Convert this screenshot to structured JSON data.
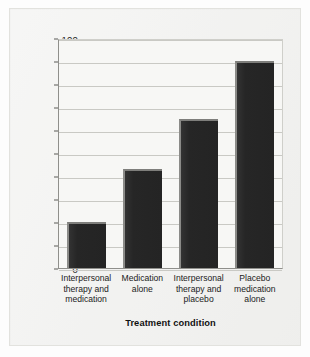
{
  "chart_data": {
    "type": "bar",
    "title": "",
    "xlabel": "Treatment condition",
    "ylabel": "Relapse rate (%)",
    "categories": [
      "Interpersonal therapy and medication",
      "Medication alone",
      "Interpersonal therapy and placebo",
      "Placebo medication alone"
    ],
    "category_lines": [
      [
        "Interpersonal",
        "therapy and",
        "medication"
      ],
      [
        "Medication",
        "alone"
      ],
      [
        "Interpersonal",
        "therapy and",
        "placebo"
      ],
      [
        "Placebo",
        "medication",
        "alone"
      ]
    ],
    "values": [
      20,
      43,
      65,
      90
    ],
    "ylim": [
      0,
      100
    ],
    "ytick_labels": [
      "0",
      "10",
      "20",
      "30",
      "40",
      "50",
      "60",
      "70",
      "80",
      "90",
      "100"
    ],
    "ytick_values": [
      0,
      10,
      20,
      30,
      40,
      50,
      60,
      70,
      80,
      90,
      100
    ],
    "grid": true,
    "legend": false,
    "colors": {
      "bar_fill": "#2b2b2b",
      "bar_bevel": "#8b8b88",
      "gridline": "#c9c9c4",
      "plot_background": "#f7f7f5",
      "page_background": "#f2f2f0",
      "axis_text": "#1b1b1b"
    }
  }
}
